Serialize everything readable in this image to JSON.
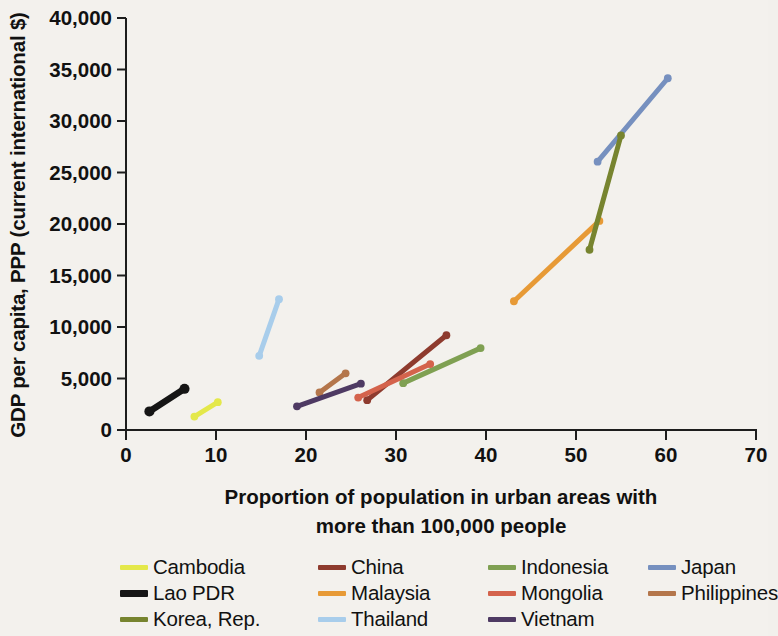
{
  "chart_data": {
    "type": "line",
    "title": "",
    "xlabel": "Proportion of population in urban areas with more than 100,000 people",
    "xlabel_line1": "Proportion of population in urban areas with",
    "xlabel_line2": "more than 100,000 people",
    "ylabel": "GDP per capita, PPP (current international $)",
    "xlim": [
      0,
      70
    ],
    "ylim": [
      0,
      40000
    ],
    "xticks": [
      0,
      10,
      20,
      30,
      40,
      50,
      60,
      70
    ],
    "xtick_labels": [
      "0",
      "10",
      "20",
      "30",
      "40",
      "50",
      "60",
      "70"
    ],
    "yticks": [
      0,
      5000,
      10000,
      15000,
      20000,
      25000,
      30000,
      35000,
      40000
    ],
    "ytick_labels": [
      "0",
      "5,000",
      "10,000",
      "15,000",
      "20,000",
      "25,000",
      "30,000",
      "35,000",
      "40,000"
    ],
    "grid": false,
    "legend_position": "bottom",
    "marker": "circle",
    "series": [
      {
        "name": "Cambodia",
        "color": "#e4e84a",
        "x": [
          7.6,
          10.2
        ],
        "y": [
          1300,
          2700
        ]
      },
      {
        "name": "China",
        "color": "#8e3b2e",
        "x": [
          26.8,
          35.6
        ],
        "y": [
          2900,
          9200
        ]
      },
      {
        "name": "Indonesia",
        "color": "#7fa052",
        "x": [
          30.8,
          39.4
        ],
        "y": [
          4550,
          7950
        ]
      },
      {
        "name": "Japan",
        "color": "#7690bf",
        "x": [
          52.4,
          60.2
        ],
        "y": [
          26050,
          34150
        ]
      },
      {
        "name": "Lao PDR",
        "color": "#151515",
        "x": [
          2.6,
          6.5
        ],
        "y": [
          1800,
          4000
        ]
      },
      {
        "name": "Malaysia",
        "color": "#e79a36",
        "x": [
          43.1,
          52.6
        ],
        "y": [
          12500,
          20300
        ]
      },
      {
        "name": "Mongolia",
        "color": "#d4634c",
        "x": [
          25.8,
          33.8
        ],
        "y": [
          3150,
          6400
        ]
      },
      {
        "name": "Philippines",
        "color": "#b4764b",
        "x": [
          21.5,
          24.4
        ],
        "y": [
          3650,
          5500
        ]
      },
      {
        "name": "Korea, Rep.",
        "color": "#77842f",
        "x": [
          51.5,
          55.0
        ],
        "y": [
          17500,
          28600
        ]
      },
      {
        "name": "Thailand",
        "color": "#a8cdeb",
        "x": [
          14.8,
          17.0
        ],
        "y": [
          7200,
          12700
        ]
      },
      {
        "name": "Vietnam",
        "color": "#4e3a63",
        "x": [
          19.0,
          26.1
        ],
        "y": [
          2300,
          4500
        ]
      }
    ]
  },
  "legend": {
    "rows": [
      [
        {
          "name": "Cambodia",
          "color": "#e4e84a",
          "thick": false
        },
        {
          "name": "China",
          "color": "#8e3b2e",
          "thick": false
        },
        {
          "name": "Indonesia",
          "color": "#7fa052",
          "thick": false
        },
        {
          "name": "Japan",
          "color": "#7690bf",
          "thick": false
        }
      ],
      [
        {
          "name": "Lao PDR",
          "color": "#151515",
          "thick": true
        },
        {
          "name": "Malaysia",
          "color": "#e79a36",
          "thick": false
        },
        {
          "name": "Mongolia",
          "color": "#d4634c",
          "thick": false
        },
        {
          "name": "Philippines",
          "color": "#b4764b",
          "thick": false
        }
      ],
      [
        {
          "name": "Korea, Rep.",
          "color": "#77842f",
          "thick": false
        },
        {
          "name": "Thailand",
          "color": "#a8cdeb",
          "thick": false
        },
        {
          "name": "Vietnam",
          "color": "#4e3a63",
          "thick": false
        }
      ]
    ]
  }
}
